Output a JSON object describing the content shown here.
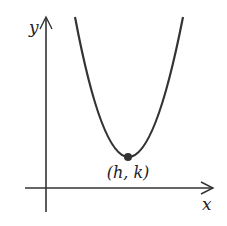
{
  "diagram": {
    "type": "parabola-graph",
    "axes": {
      "x_label": "x",
      "y_label": "y"
    },
    "vertex": {
      "label": "(h, k)"
    },
    "colors": {
      "stroke": "#333333",
      "text": "#222222",
      "background": "#ffffff"
    }
  }
}
